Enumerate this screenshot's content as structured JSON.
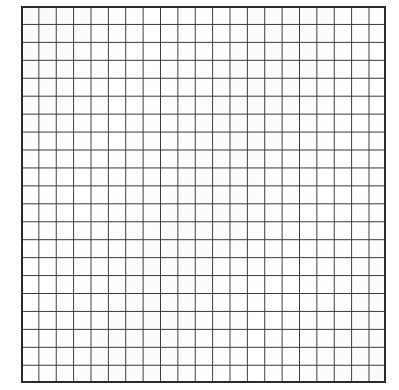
{
  "page": {
    "kind": "grid-sheet",
    "width_px": 399,
    "height_px": 390,
    "background_color": "#ffffff"
  },
  "grid": {
    "origin_x_px": 21,
    "origin_y_px": 6,
    "width_px": 365,
    "height_px": 377,
    "columns": 21,
    "rows": 21,
    "cell_width_px": 17.38,
    "cell_height_px": 17.95,
    "line_color": "#3a3a3a",
    "line_width_px": 1,
    "border_color": "#2b2b2b",
    "border_width_px": 2,
    "cell_fill_color": "#ffffff",
    "has_minor_subdivisions": false,
    "has_labels": false,
    "has_axis_ticks": false,
    "has_annotations": false
  },
  "margins": {
    "left_px": 21,
    "top_px": 6,
    "right_px": 13,
    "bottom_px": 7
  }
}
